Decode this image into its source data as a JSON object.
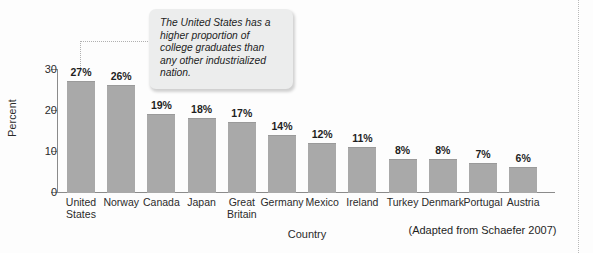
{
  "chart_data": {
    "type": "bar",
    "title": "",
    "xlabel": "Country",
    "ylabel": "Percent",
    "ylim": [
      0,
      30
    ],
    "yticks": [
      0,
      10,
      20,
      30
    ],
    "ytick_labels": [
      "0",
      "10",
      "20",
      "30"
    ],
    "grid": false,
    "legend": null,
    "value_suffix": "%",
    "categories": [
      "United States",
      "Norway",
      "Canada",
      "Japan",
      "Great Britain",
      "Germany",
      "Mexico",
      "Ireland",
      "Turkey",
      "Denmark",
      "Portugal",
      "Austria"
    ],
    "category_label_lines": [
      "United\nStates",
      "Norway",
      "Canada",
      "Japan",
      "Great\nBritain",
      "Germany",
      "Mexico",
      "Ireland",
      "Turkey",
      "Denmark",
      "Portugal",
      "Austria"
    ],
    "values": [
      27,
      26,
      19,
      18,
      17,
      14,
      12,
      11,
      8,
      8,
      7,
      6
    ],
    "value_labels": [
      "27%",
      "26%",
      "19%",
      "18%",
      "17%",
      "14%",
      "12%",
      "11%",
      "8%",
      "8%",
      "7%",
      "6%"
    ],
    "bar_color": "#a9a9a9",
    "axis_color": "#8b8b8b"
  },
  "annotation": {
    "callout_text": "The United States has a higher proportion of college graduates than any other industrialized nation.",
    "points_to_category": "United States"
  },
  "attribution": {
    "text": "(Adapted from Schaefer 2007)"
  }
}
